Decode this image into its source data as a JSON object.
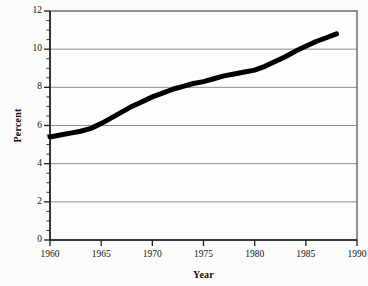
{
  "chart_data": {
    "type": "line",
    "title": "",
    "xlabel": "Year",
    "ylabel": "Percent",
    "xlim": [
      1960,
      1990
    ],
    "ylim": [
      0,
      12
    ],
    "grid": true,
    "legend": "none",
    "x_ticks": [
      "1960",
      "1965",
      "1970",
      "1975",
      "1980",
      "1985",
      "1990"
    ],
    "y_ticks": [
      "0",
      "2",
      "4",
      "6",
      "8",
      "10",
      "12"
    ],
    "x_tick_values": [
      1960,
      1965,
      1970,
      1975,
      1980,
      1985,
      1990
    ],
    "y_tick_values": [
      0,
      2,
      4,
      6,
      8,
      10,
      12
    ],
    "y_minor_tick_step": 0.5,
    "series": [
      {
        "name": "Percent",
        "color": "#000000",
        "line_width": 5,
        "x": [
          1960,
          1961,
          1962,
          1963,
          1964,
          1965,
          1966,
          1967,
          1968,
          1969,
          1970,
          1971,
          1972,
          1973,
          1974,
          1975,
          1976,
          1977,
          1978,
          1979,
          1980,
          1981,
          1982,
          1983,
          1984,
          1985,
          1986,
          1987,
          1988
        ],
        "values": [
          5.4,
          5.5,
          5.6,
          5.7,
          5.85,
          6.1,
          6.4,
          6.7,
          7.0,
          7.25,
          7.5,
          7.7,
          7.9,
          8.05,
          8.2,
          8.3,
          8.45,
          8.6,
          8.7,
          8.8,
          8.9,
          9.1,
          9.35,
          9.6,
          9.9,
          10.15,
          10.4,
          10.6,
          10.8
        ]
      }
    ],
    "annotations": []
  },
  "axes": {
    "ylabel_text": "Percent",
    "xlabel_text": "Year"
  }
}
